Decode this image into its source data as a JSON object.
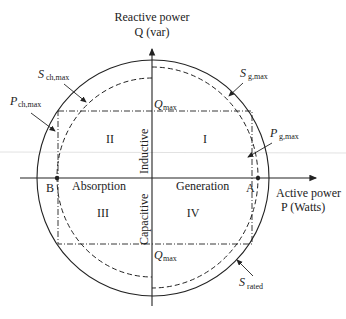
{
  "figure": {
    "type": "P-Q capability diagram",
    "axes": {
      "y_title": "Reactive power",
      "y_unit": "Q (var)",
      "x_title": "Active power",
      "x_unit": "P (Watts)"
    },
    "quadrants": {
      "q1": "I",
      "q2": "II",
      "q3": "III",
      "q4": "IV"
    },
    "region_labels": {
      "inductive": "Inductive",
      "capacitive": "Capacitive",
      "absorption": "Absorption",
      "generation": "Generation"
    },
    "points": {
      "a": "A",
      "b": "B"
    },
    "annotations": {
      "s_ch_max": {
        "main": "S",
        "sub": "ch,max"
      },
      "p_ch_max": {
        "main": "P",
        "sub": "ch,max"
      },
      "s_g_max": {
        "main": "S",
        "sub": "g,max"
      },
      "p_g_max": {
        "main": "P",
        "sub": "g,max"
      },
      "s_rated": {
        "main": "S",
        "sub": "rated"
      },
      "q_max_top": {
        "main": "Q",
        "sub": "max"
      },
      "q_max_bottom": {
        "main": "Q",
        "sub": "max"
      }
    },
    "colors": {
      "line": "#222222",
      "background": "#ffffff"
    }
  }
}
